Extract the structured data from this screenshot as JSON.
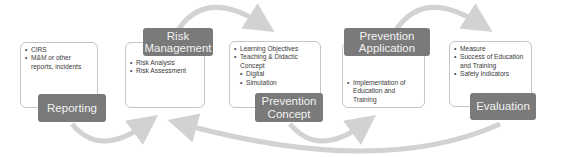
{
  "diagram": {
    "type": "cycle-process",
    "arrow_color": "#d2d2d2",
    "label_color": "#7a7a7a",
    "stages": [
      {
        "label": "Reporting",
        "items": [
          {
            "text": "CIRS",
            "level": 1
          },
          {
            "text": "M&M or other reports, incidents",
            "level": 1
          }
        ]
      },
      {
        "label": "Risk Management",
        "items": [
          {
            "text": "Risk Analysis",
            "level": 1
          },
          {
            "text": "Risk Assessment",
            "level": 1
          }
        ]
      },
      {
        "label": "Prevention Concept",
        "items": [
          {
            "text": "Learning Objectives",
            "level": 1
          },
          {
            "text": "Teaching & Didactic Concept",
            "level": 1
          },
          {
            "text": "Digital",
            "level": 2
          },
          {
            "text": "Simulation",
            "level": 2
          }
        ]
      },
      {
        "label": "Prevention Application",
        "items": [
          {
            "text": "Implementation of Education and Training",
            "level": 1
          }
        ]
      },
      {
        "label": "Evaluation",
        "items": [
          {
            "text": "Measure",
            "level": 1
          },
          {
            "text": "Success of Education and Training",
            "level": 1
          },
          {
            "text": "Safety Indicators",
            "level": 1
          }
        ]
      }
    ]
  }
}
